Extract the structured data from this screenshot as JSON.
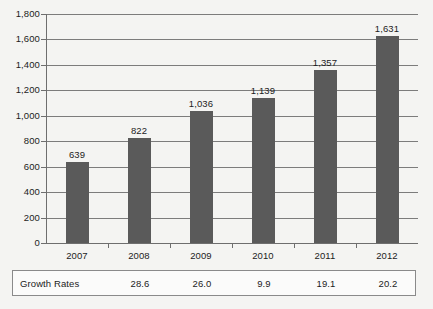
{
  "chart_data": {
    "type": "bar",
    "title": "",
    "subtitle": "",
    "xlabel": "",
    "ylabel": "",
    "categories": [
      "2007",
      "2008",
      "2009",
      "2010",
      "2011",
      "2012"
    ],
    "values": [
      639,
      822,
      1036,
      1139,
      1357,
      1631
    ],
    "value_labels": [
      "639",
      "822",
      "1,036",
      "1,139",
      "1,357",
      "1,631"
    ],
    "ylim": [
      0,
      1800
    ],
    "ytick_values": [
      0,
      200,
      400,
      600,
      800,
      1000,
      1200,
      1400,
      1600,
      1800
    ],
    "ytick_labels": [
      "0",
      "200",
      "400",
      "600",
      "800",
      "1,000",
      "1,200",
      "1,400",
      "1,600",
      "1,800"
    ],
    "grid": true,
    "legend": "none",
    "bar_color": "#5a5a5a",
    "axis_color": "#6e6e6e",
    "grid_color": "#7c7c7c",
    "text_color": "#1c1c1c",
    "background_color": "#f4f4f2"
  },
  "growth_table": {
    "row_label": "Growth Rates",
    "values": [
      "",
      "28.6",
      "26.0",
      "9.9",
      "19.1",
      "20.2"
    ],
    "border_color": "#8a8a8a"
  }
}
